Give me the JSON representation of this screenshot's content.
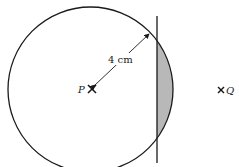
{
  "diagram": {
    "radius_label": "4 cm",
    "point_p_label": "P",
    "point_q_label": "Q",
    "colors": {
      "stroke": "#1a1a1a",
      "shaded": "#b8b8b8",
      "background": "#ffffff"
    }
  }
}
